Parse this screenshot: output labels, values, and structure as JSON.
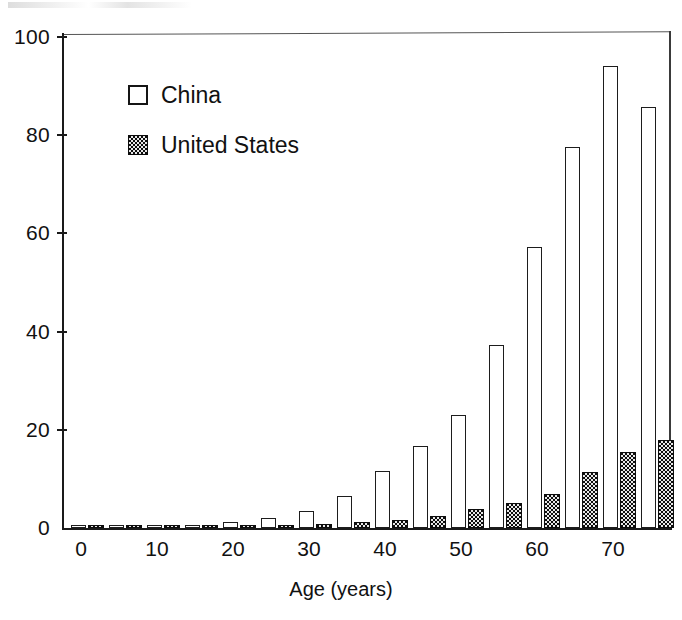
{
  "chart_data": {
    "type": "bar",
    "title": "",
    "subtitle": "",
    "xlabel": "Age (years)",
    "ylabel": "",
    "xlim": [
      -2.5,
      77.5
    ],
    "ylim": [
      0,
      100
    ],
    "grid": false,
    "legend_position": "upper-left-inside",
    "categories": [
      0,
      5,
      10,
      15,
      20,
      25,
      30,
      35,
      40,
      45,
      50,
      55,
      60,
      65,
      70,
      75
    ],
    "xticks": [
      "0",
      "10",
      "20",
      "30",
      "40",
      "50",
      "60",
      "70"
    ],
    "xtick_values": [
      0,
      10,
      20,
      30,
      40,
      50,
      60,
      70
    ],
    "yticks": [
      "0",
      "20",
      "40",
      "60",
      "80",
      "100"
    ],
    "ytick_values": [
      0,
      20,
      40,
      60,
      80,
      100
    ],
    "series": [
      {
        "name": "China",
        "fill": "open",
        "color": "#ffffff",
        "edge_color": "#1d1d1d",
        "values": [
          0.3,
          0.4,
          0.5,
          0.7,
          1.2,
          2.0,
          3.5,
          6.5,
          11.7,
          16.8,
          23.0,
          37.3,
          57.3,
          77.5,
          94.0,
          85.8
        ]
      },
      {
        "name": "United States",
        "fill": "checkered",
        "color": "#0d0d0d",
        "edge_color": "#0c0c0c",
        "values": [
          0.3,
          0.3,
          0.4,
          0.5,
          0.6,
          0.7,
          0.9,
          1.2,
          1.6,
          2.5,
          3.8,
          5.0,
          7.0,
          11.5,
          15.5,
          18.0
        ]
      }
    ]
  },
  "legend": {
    "items": [
      {
        "label": "China",
        "swatch": "open-square-swatch"
      },
      {
        "label": "United States",
        "swatch": "checkered-square-swatch"
      }
    ]
  },
  "axes": {
    "x_title": "Age (years)"
  }
}
